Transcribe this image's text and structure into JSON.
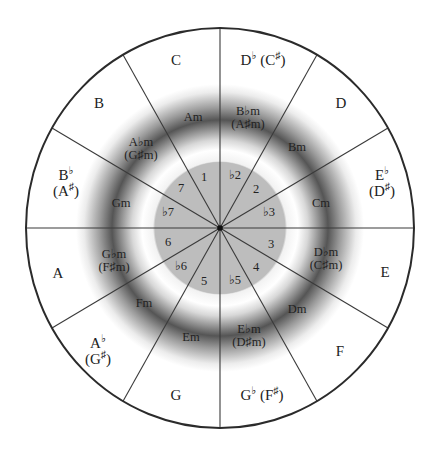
{
  "diagram": {
    "colors": {
      "background": "#ffffff",
      "outline": "#333333",
      "inner_disk": "#bdbdbd",
      "ring_shadow": "#555555"
    },
    "geometry": {
      "center": [
        220,
        228
      ],
      "outer_rx": 194,
      "outer_ry": 200,
      "inner_disk_r": 66,
      "shadow_ring_r": 108,
      "radial_line_angles_deg": [
        0,
        30,
        60,
        90,
        120,
        150,
        180,
        210,
        240,
        270,
        300,
        330
      ]
    },
    "major_keys": [
      {
        "id": "c",
        "main": "C",
        "acc": "",
        "alt": "",
        "alt_acc": ""
      },
      {
        "id": "db",
        "main": "D",
        "acc": "♭",
        "alt": "C",
        "alt_acc": "♯",
        "inline": true
      },
      {
        "id": "d",
        "main": "D",
        "acc": "",
        "alt": "",
        "alt_acc": ""
      },
      {
        "id": "eb",
        "main": "E",
        "acc": "♭",
        "alt": "D",
        "alt_acc": "♯"
      },
      {
        "id": "e",
        "main": "E",
        "acc": "",
        "alt": "",
        "alt_acc": ""
      },
      {
        "id": "f",
        "main": "F",
        "acc": "",
        "alt": "",
        "alt_acc": ""
      },
      {
        "id": "gb",
        "main": "G",
        "acc": "♭",
        "alt": "F",
        "alt_acc": "♯",
        "inline": true
      },
      {
        "id": "g",
        "main": "G",
        "acc": "",
        "alt": "",
        "alt_acc": ""
      },
      {
        "id": "ab",
        "main": "A",
        "acc": "♭",
        "alt": "G",
        "alt_acc": "♯"
      },
      {
        "id": "a",
        "main": "A",
        "acc": "",
        "alt": "",
        "alt_acc": ""
      },
      {
        "id": "bb",
        "main": "B",
        "acc": "♭",
        "alt": "A",
        "alt_acc": "♯"
      },
      {
        "id": "b",
        "main": "B",
        "acc": "",
        "alt": "",
        "alt_acc": ""
      }
    ],
    "minor_keys": [
      {
        "id": "am",
        "main": "Am"
      },
      {
        "id": "bbm",
        "main": "B♭m",
        "alt": "(A♯m)"
      },
      {
        "id": "bm",
        "main": "Bm"
      },
      {
        "id": "cm",
        "main": "Cm"
      },
      {
        "id": "dbm",
        "main": "D♭m",
        "alt": "(C♯m)"
      },
      {
        "id": "dm",
        "main": "Dm"
      },
      {
        "id": "ebm",
        "main": "E♭m",
        "alt": "(D♯m)"
      },
      {
        "id": "em",
        "main": "Em"
      },
      {
        "id": "fm",
        "main": "Fm"
      },
      {
        "id": "gbm",
        "main": "G♭m",
        "alt": "(F♯m)"
      },
      {
        "id": "gm",
        "main": "Gm"
      },
      {
        "id": "abm",
        "main": "A♭m",
        "alt": "(G♯m)"
      }
    ],
    "scale_degrees": [
      "1",
      "♭2",
      "2",
      "♭3",
      "3",
      "4",
      "♭5",
      "5",
      "♭6",
      "6",
      "♭7",
      "7"
    ]
  }
}
